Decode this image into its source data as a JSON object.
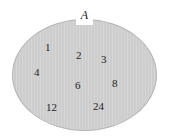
{
  "diagram": {
    "type": "set-diagram",
    "kind": "venn-single-set",
    "set_label": "A",
    "background_color": "#ffffff",
    "set_fill_color": "#cdcdcd",
    "set_border_color": "#b4b4b4",
    "text_color": "#232323",
    "members": [
      {
        "value": "1",
        "x": 45,
        "y": 41
      },
      {
        "value": "2",
        "x": 76,
        "y": 49
      },
      {
        "value": "3",
        "x": 101,
        "y": 53
      },
      {
        "value": "4",
        "x": 34,
        "y": 66
      },
      {
        "value": "6",
        "x": 75,
        "y": 79
      },
      {
        "value": "8",
        "x": 112,
        "y": 77
      },
      {
        "value": "12",
        "x": 46,
        "y": 101
      },
      {
        "value": "24",
        "x": 93,
        "y": 100
      }
    ]
  }
}
